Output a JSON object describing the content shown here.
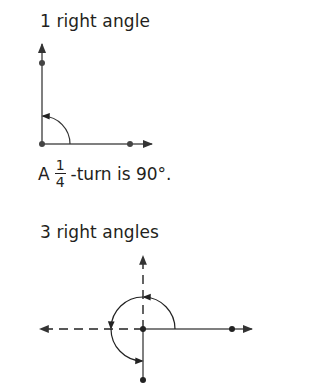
{
  "sections": [
    {
      "title": "1 right angle",
      "caption": {
        "prefix": "A",
        "fraction": {
          "numerator": "1",
          "denominator": "4"
        },
        "suffix": "-turn is 90°."
      }
    },
    {
      "title": "3 right angles"
    }
  ],
  "colors": {
    "text": "#231f20",
    "line": "#555555",
    "dashed_line": "#222222"
  }
}
